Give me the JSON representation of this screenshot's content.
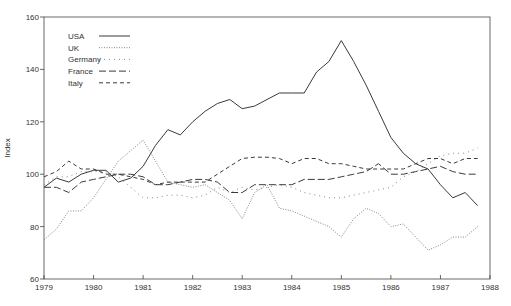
{
  "chart_data": {
    "type": "line",
    "title": "",
    "xlabel": "",
    "ylabel": "Index",
    "xlim": [
      1979,
      1988
    ],
    "ylim": [
      60,
      160
    ],
    "x_ticks": [
      "1979",
      "1980",
      "1981",
      "1982",
      "1983",
      "1984",
      "1985",
      "1986",
      "1987",
      "1988"
    ],
    "y_ticks": [
      "60",
      "80",
      "100",
      "120",
      "140",
      "160"
    ],
    "grid": false,
    "legend_position": "upper-left",
    "x": [
      1979.0,
      1979.25,
      1979.5,
      1979.75,
      1980.0,
      1980.25,
      1980.5,
      1980.75,
      1981.0,
      1981.25,
      1981.5,
      1981.75,
      1982.0,
      1982.25,
      1982.5,
      1982.75,
      1983.0,
      1983.25,
      1983.5,
      1983.75,
      1984.0,
      1984.25,
      1984.5,
      1984.75,
      1985.0,
      1985.25,
      1985.5,
      1985.75,
      1986.0,
      1986.25,
      1986.5,
      1986.75,
      1987.0,
      1987.25,
      1987.5,
      1987.75
    ],
    "series": [
      {
        "name": "USA",
        "style": "solid",
        "values": [
          95,
          98.5,
          97,
          100,
          101.5,
          101.5,
          97,
          98.5,
          103,
          111,
          117,
          115,
          120,
          124,
          127,
          128.5,
          125,
          126,
          128.5,
          131,
          131,
          131,
          139,
          143,
          151,
          143,
          134,
          124,
          114,
          108,
          104,
          102,
          96,
          91,
          93,
          88
        ]
      },
      {
        "name": "UK",
        "style": "dotted",
        "values": [
          75,
          79,
          86,
          86,
          91,
          98,
          105,
          109,
          113,
          105,
          97,
          96,
          95,
          96,
          93,
          90,
          83,
          93,
          96,
          87,
          86,
          84,
          82,
          80,
          76,
          83,
          87,
          85,
          80,
          81,
          76,
          71,
          73,
          76,
          76,
          80
        ]
      },
      {
        "name": "Germany",
        "style": "sparse-dots",
        "values": [
          96,
          99,
          99,
          101,
          101,
          101,
          99,
          95,
          91,
          91,
          92,
          92,
          91,
          92,
          95,
          93,
          95,
          94,
          95,
          96,
          95,
          93,
          92,
          91,
          91,
          92,
          93,
          94,
          95,
          99,
          101,
          104,
          107,
          108,
          108,
          110
        ]
      },
      {
        "name": "France",
        "style": "long-dash",
        "values": [
          95,
          95,
          93,
          97,
          98,
          99,
          100,
          100,
          99,
          96,
          96,
          97,
          98,
          98,
          97,
          93,
          93,
          96,
          96,
          96,
          96,
          98,
          98,
          98,
          99,
          100,
          101,
          104,
          100,
          100,
          101,
          102,
          103,
          101,
          100,
          100
        ]
      },
      {
        "name": "Italy",
        "style": "short-dash",
        "values": [
          99,
          101,
          105,
          102,
          102,
          100,
          100,
          99,
          98,
          96,
          97,
          97,
          97,
          97,
          100,
          103,
          106,
          106.5,
          106.5,
          106,
          104,
          106,
          106,
          104,
          104,
          103,
          102,
          102,
          102,
          102,
          104,
          106,
          106,
          104,
          106,
          106
        ]
      }
    ]
  },
  "legend": {
    "items": [
      {
        "label": "USA"
      },
      {
        "label": "UK"
      },
      {
        "label": "Germany"
      },
      {
        "label": "France"
      },
      {
        "label": "Italy"
      }
    ]
  },
  "axes": {
    "ylabel": "Index"
  },
  "colors": {
    "line": "#3a3a3a",
    "axis": "#444444",
    "background": "#ffffff"
  }
}
